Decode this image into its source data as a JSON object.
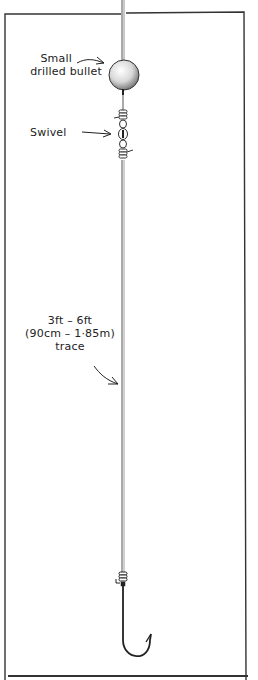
{
  "diagram": {
    "colors": {
      "ink": "#222222",
      "line": "#555555",
      "background": "#ffffff"
    },
    "components": [
      {
        "id": "main-line",
        "icon": "line-icon"
      },
      {
        "id": "bullet",
        "icon": "bullet-sinker-icon"
      },
      {
        "id": "swivel",
        "icon": "swivel-icon"
      },
      {
        "id": "trace",
        "icon": "line-icon"
      },
      {
        "id": "hook",
        "icon": "hook-icon"
      }
    ],
    "labels": {
      "bullet": {
        "line1": "Small",
        "line2": "drilled bullet"
      },
      "swivel": {
        "text": "Swivel"
      },
      "trace": {
        "line1": "3ft – 6ft",
        "line2": "(90cm – 1·85m)",
        "line3": "trace"
      }
    }
  }
}
